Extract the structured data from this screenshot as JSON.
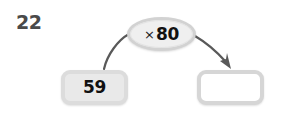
{
  "problem": {
    "number": "22",
    "type": "function-machine"
  },
  "operation": {
    "symbol": "×",
    "value": "80",
    "full_label": "× 80"
  },
  "boxes": {
    "input": {
      "value": "59",
      "filled": true
    },
    "output": {
      "value": "",
      "placeholder": "",
      "filled": false
    }
  },
  "arrows": {
    "input_to_operation": "curve-up-right",
    "operation_to_output": "curve-down-right-arrowhead"
  },
  "colors": {
    "background": "#ffffff",
    "number_text": "#4a4a4a",
    "value_text": "#111111",
    "box_fill_filled": "#e9e9e9",
    "box_fill_empty": "#ffffff",
    "box_border": "#dcdcdc",
    "oval_fill": "#efefef",
    "oval_border": "#d2d2d2",
    "arrow_stroke": "#595959"
  }
}
